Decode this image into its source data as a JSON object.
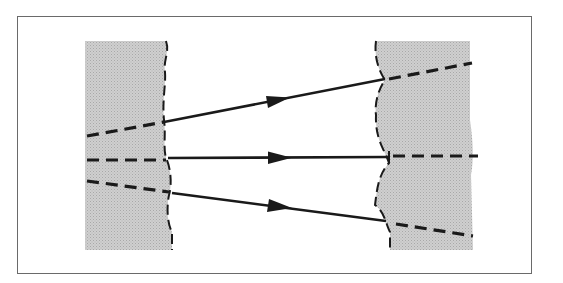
{
  "diagram": {
    "colors": {
      "medium_fill": "#c8c8c8",
      "line": "#1a1a1a",
      "frame": "#6a6a6a",
      "background": "#ffffff"
    },
    "left_medium": {
      "x": 85,
      "y": 41,
      "right_edge_x": 170,
      "height": 209
    },
    "right_medium": {
      "x": 378,
      "y": 41,
      "right_edge_x": 473,
      "height": 209
    },
    "rays": [
      {
        "name": "upper",
        "dashed_in": [
          [
            87,
            136
          ],
          [
            164,
            122
          ]
        ],
        "solid": [
          [
            164,
            122
          ],
          [
            384,
            79
          ]
        ],
        "dashed_out": [
          [
            389,
            79
          ],
          [
            470,
            63
          ]
        ]
      },
      {
        "name": "middle",
        "dashed_in": [
          [
            87,
            160
          ],
          [
            166,
            160
          ]
        ],
        "solid": [
          [
            168,
            158
          ],
          [
            389,
            157
          ]
        ],
        "dashed_out": [
          [
            393,
            156
          ],
          [
            478,
            156
          ]
        ]
      },
      {
        "name": "lower",
        "dashed_in": [
          [
            87,
            181
          ],
          [
            169,
            192
          ]
        ],
        "solid": [
          [
            172,
            193
          ],
          [
            385,
            221
          ]
        ],
        "dashed_out": [
          [
            397,
            225
          ],
          [
            473,
            236
          ]
        ]
      }
    ],
    "arrowheads": [
      {
        "ray": "upper",
        "x": 282,
        "y": 100
      },
      {
        "ray": "middle",
        "x": 282,
        "y": 158
      },
      {
        "ray": "lower",
        "x": 282,
        "y": 208
      }
    ]
  }
}
